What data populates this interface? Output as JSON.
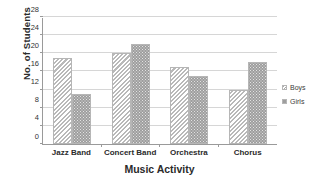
{
  "chart_data": {
    "type": "bar",
    "title": "",
    "xlabel": "Music Activity",
    "ylabel": "No. of Students",
    "categories": [
      "Jazz Band",
      "Concert Band",
      "Orchestra",
      "Chorus"
    ],
    "series": [
      {
        "name": "Boys",
        "values": [
          19,
          20,
          17,
          12
        ],
        "pattern": "diagonal-hatch",
        "color": "#b9b9b9"
      },
      {
        "name": "Girls",
        "values": [
          11,
          22,
          15,
          18
        ],
        "pattern": "dotted-fill",
        "color": "#9e9e9e"
      }
    ],
    "ylim": [
      0,
      28
    ],
    "ytick_step": 4,
    "yticks": [
      0,
      4,
      8,
      12,
      16,
      20,
      24,
      28
    ],
    "ytick_labels": [
      "0",
      "4",
      "8",
      "12",
      "16",
      "20",
      "24",
      "28"
    ],
    "grid": true,
    "grid_axis": "y",
    "legend_position": "right",
    "legend": [
      "Boys",
      "Girls"
    ]
  }
}
